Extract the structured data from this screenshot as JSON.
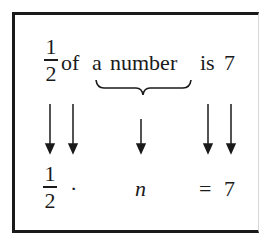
{
  "statement": {
    "fraction": {
      "numerator": "1",
      "denominator": "2"
    },
    "words": [
      {
        "id": "of",
        "text": "of"
      },
      {
        "id": "a",
        "text": "a"
      },
      {
        "id": "number",
        "text": "number"
      },
      {
        "id": "is",
        "text": "is"
      },
      {
        "id": "seven",
        "text": "7"
      }
    ],
    "brace_label": "a number"
  },
  "equation": {
    "fraction": {
      "numerator": "1",
      "denominator": "2"
    },
    "operator": "·",
    "variable": "n",
    "equals": "=",
    "result": "7"
  },
  "arrows": [
    {
      "from": "1/2",
      "to": "1/2"
    },
    {
      "from": "of",
      "to": "·"
    },
    {
      "from": "a number",
      "to": "n"
    },
    {
      "from": "is",
      "to": "="
    },
    {
      "from": "7",
      "to": "7"
    }
  ],
  "colors": {
    "ink": "#1a1a1a",
    "background": "#ffffff"
  }
}
